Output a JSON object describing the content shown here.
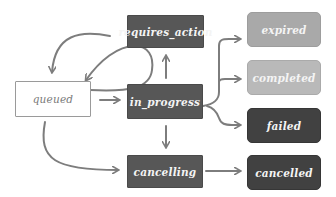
{
  "diagram": {
    "type": "state-diagram",
    "nodes": {
      "queued": {
        "label": "queued",
        "style": "outline"
      },
      "requires_action": {
        "label": "requires_action",
        "style": "dark"
      },
      "in_progress": {
        "label": "in_progress",
        "style": "dark"
      },
      "cancelling": {
        "label": "cancelling",
        "style": "dark"
      },
      "expired": {
        "label": "expired",
        "style": "light"
      },
      "completed": {
        "label": "completed",
        "style": "light"
      },
      "failed": {
        "label": "failed",
        "style": "darker"
      },
      "cancelled": {
        "label": "cancelled",
        "style": "darker"
      }
    },
    "edges": [
      {
        "from": "queued",
        "to": "in_progress"
      },
      {
        "from": "queued",
        "to": "cancelling"
      },
      {
        "from": "queued",
        "to": "expired"
      },
      {
        "from": "requires_action",
        "to": "queued"
      },
      {
        "from": "in_progress",
        "to": "requires_action"
      },
      {
        "from": "in_progress",
        "to": "queued"
      },
      {
        "from": "in_progress",
        "to": "cancelling"
      },
      {
        "from": "in_progress",
        "to": "expired"
      },
      {
        "from": "in_progress",
        "to": "completed"
      },
      {
        "from": "in_progress",
        "to": "failed"
      },
      {
        "from": "cancelling",
        "to": "cancelled"
      }
    ],
    "colors": {
      "edge": "#7d7d7d",
      "dark_node": "#575757",
      "darker_node": "#414141",
      "light_node": "#a9a9a9",
      "lighter_node": "#b9b9b9",
      "outline_border": "#9a9a9a"
    }
  }
}
